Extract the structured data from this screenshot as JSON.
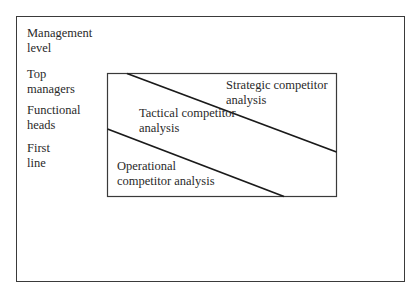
{
  "diagram": {
    "axis_header": [
      "Management",
      "level"
    ],
    "levels": [
      {
        "lines": [
          "Top",
          "managers"
        ]
      },
      {
        "lines": [
          "Functional",
          "heads"
        ]
      },
      {
        "lines": [
          "First",
          "line"
        ]
      }
    ],
    "regions": [
      {
        "name": "strategic",
        "lines": [
          "Strategic competitor",
          "analysis"
        ]
      },
      {
        "name": "tactical",
        "lines": [
          "Tactical competitor",
          "analysis"
        ]
      },
      {
        "name": "operational",
        "lines": [
          "Operational",
          "competitor analysis"
        ]
      }
    ],
    "colors": {
      "line": "#1a1a1a",
      "border": "#3a3a3a",
      "text": "#2a2a2a",
      "background": "#ffffff"
    }
  }
}
